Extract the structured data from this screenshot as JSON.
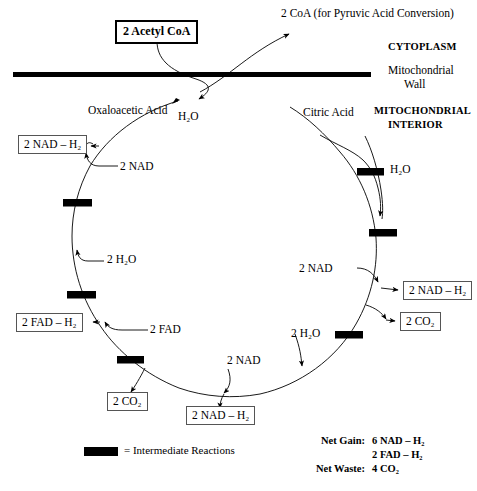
{
  "diagram": {
    "title_box": "2 Acetyl CoA",
    "membrane_labels": {
      "cytoplasm": "CYTOPLASM",
      "wall_line1": "Mitochondrial",
      "wall_line2": "Wall",
      "interior_line1": "MITOCHONDRIAL",
      "interior_line2": "INTERIOR"
    },
    "top_output": "2 CoA (for Pyruvic Acid Conversion)",
    "cycle_nodes": {
      "oxaloacetic": "Oxaloacetic Acid",
      "citric": "Citric Acid"
    },
    "inputs": {
      "water_top": "H₂O",
      "nad_upper_left": "2 NAD",
      "water_left": "2 H₂O",
      "fad_left": "2 FAD",
      "nad_bottom": "2 NAD",
      "water_bottom_right": "2 H₂O",
      "nad_right": "2 NAD",
      "water_upper_right": "H₂O"
    },
    "outputs": {
      "nadh2_upper_left": "2 NAD – H₂",
      "fadh2_left": "2 FAD – H₂",
      "co2_bottom_left": "2 CO₂",
      "nadh2_bottom": "2 NAD – H₂",
      "nadh2_right": "2 NAD – H₂",
      "co2_right": "2 CO₂"
    },
    "legend": {
      "symbol_name": "intermediate-reaction-bar",
      "text": "= Intermediate Reactions",
      "bar_color": "#000000"
    },
    "net_summary": {
      "gain_label": "Net Gain:",
      "gain_values": [
        "6 NAD – H₂",
        "2 FAD – H₂"
      ],
      "waste_label": "Net Waste:",
      "waste_values": [
        "4 CO₂"
      ]
    },
    "colors": {
      "ink": "#000000",
      "box_border": "#555555",
      "background": "#ffffff"
    }
  }
}
